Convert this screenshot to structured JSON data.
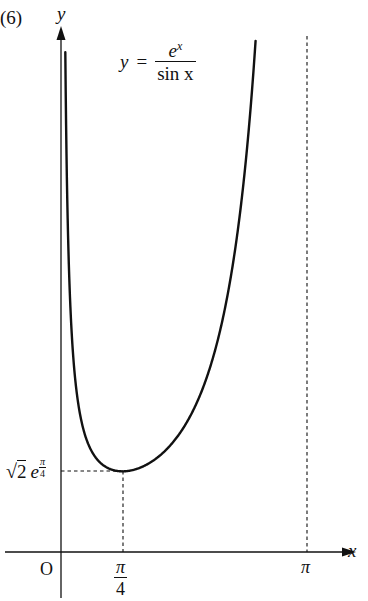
{
  "problem_number": "(6)",
  "axes": {
    "x_label": "x",
    "y_label": "y",
    "origin_label": "O"
  },
  "equation": {
    "lhs": "y",
    "equals": "=",
    "numerator": "e",
    "numerator_exp": "x",
    "denominator": "sin x"
  },
  "ticks": {
    "pi_over_4_num": "π",
    "pi_over_4_den": "4",
    "pi": "π"
  },
  "min_label": {
    "sqrt_radicand": "2",
    "base": "e",
    "exp_num": "π",
    "exp_den": "4"
  },
  "chart_data": {
    "type": "line",
    "xlabel": "x",
    "ylabel": "y",
    "domain": [
      0,
      3.14159
    ],
    "series": [
      {
        "name": "y = e^x / sin x",
        "x": [
          0.05,
          0.1,
          0.2,
          0.3,
          0.4,
          0.5,
          0.6,
          0.7,
          0.785,
          0.9,
          1.0,
          1.2,
          1.4,
          1.6,
          1.8,
          2.0,
          2.2,
          2.4,
          2.5
        ],
        "y": [
          21.0,
          11.07,
          6.13,
          4.56,
          3.84,
          3.44,
          3.22,
          3.12,
          3.1,
          3.14,
          3.23,
          3.57,
          4.09,
          4.96,
          6.2,
          8.13,
          11.1,
          16.3,
          20.4
        ]
      }
    ],
    "minimum": {
      "x": "π/4",
      "y": "√2·e^(π/4)",
      "x_value": 0.785,
      "y_value": 3.1
    },
    "asymptotes": [
      "x = 0",
      "x = π"
    ],
    "x_ticks": [
      "π/4",
      "π"
    ],
    "y_ticks": [
      "√2 e^(π/4)"
    ],
    "grid": false,
    "legend": "none"
  }
}
